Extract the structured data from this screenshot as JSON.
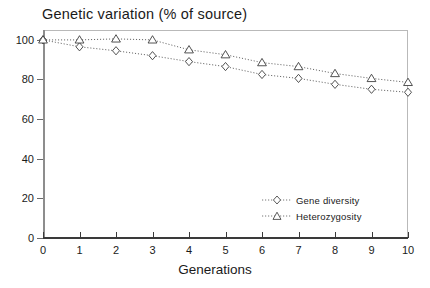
{
  "chart_data": {
    "type": "line",
    "title": "Genetic variation (% of source)",
    "xlabel": "Generations",
    "ylabel": "",
    "x": [
      0,
      1,
      2,
      3,
      4,
      5,
      6,
      7,
      8,
      9,
      10
    ],
    "xlim": [
      0,
      10
    ],
    "ylim": [
      0,
      105
    ],
    "xticks": [
      "0",
      "1",
      "2",
      "3",
      "4",
      "5",
      "6",
      "7",
      "8",
      "9",
      "10"
    ],
    "yticks": [
      "0",
      "20",
      "40",
      "60",
      "80",
      "100"
    ],
    "grid": false,
    "legend_position": "lower-right",
    "series": [
      {
        "name": "Gene diversity",
        "marker": "diamond",
        "linestyle": "dotted",
        "color": "#555555",
        "values": [
          100,
          96.5,
          94.5,
          92,
          89,
          86.5,
          82.5,
          80.5,
          77.5,
          75,
          73.5
        ]
      },
      {
        "name": "Heterozygosity",
        "marker": "triangle",
        "linestyle": "dotted",
        "color": "#555555",
        "values": [
          100,
          100,
          100.5,
          100,
          95,
          92.5,
          88.5,
          86.5,
          83,
          80.5,
          78.5
        ]
      }
    ]
  },
  "legend": {
    "items": [
      {
        "label": "Gene diversity"
      },
      {
        "label": "Heterozygosity"
      }
    ]
  }
}
